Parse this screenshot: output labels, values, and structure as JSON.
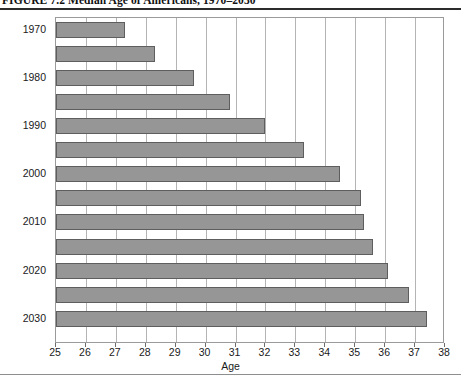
{
  "figure": {
    "title": "FIGURE 7.2   Median Age of Americans, 1970–2030"
  },
  "chart_data": {
    "type": "bar",
    "orientation": "horizontal",
    "title": "FIGURE 7.2   Median Age of Americans, 1970–2030",
    "xlabel": "Age",
    "ylabel": "",
    "xlim": [
      25,
      38
    ],
    "ylim": null,
    "grid": true,
    "legend": null,
    "bar_color": "#969696",
    "bar_edge_color": "#5e5e5e",
    "categories": [
      "1970",
      "1975",
      "1980",
      "1985",
      "1990",
      "1995",
      "2000",
      "2005",
      "2010",
      "2015",
      "2020",
      "2025",
      "2030"
    ],
    "values": [
      27.3,
      28.3,
      29.6,
      30.8,
      32.0,
      33.3,
      34.5,
      35.2,
      35.3,
      35.6,
      36.1,
      36.8,
      37.4
    ],
    "y_tick_labels": [
      "1970",
      "1980",
      "1990",
      "2000",
      "2010",
      "2020",
      "2030"
    ],
    "y_tick_categories": [
      "1970",
      "1980",
      "1990",
      "2000",
      "2010",
      "2020",
      "2030"
    ],
    "x_tick_labels": [
      "25",
      "26",
      "27",
      "28",
      "29",
      "30",
      "31",
      "32",
      "33",
      "34",
      "35",
      "36",
      "37",
      "38"
    ],
    "x_ticks": [
      25,
      26,
      27,
      28,
      29,
      30,
      31,
      32,
      33,
      34,
      35,
      36,
      37,
      38
    ]
  }
}
